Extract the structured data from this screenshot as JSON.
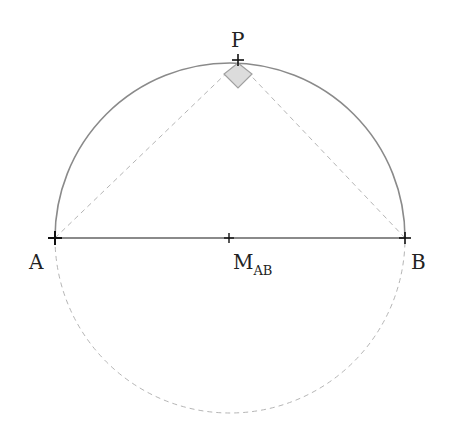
{
  "diagram": {
    "points": {
      "A": {
        "label": "A",
        "x": 55,
        "y": 238
      },
      "B": {
        "label": "B",
        "x": 405,
        "y": 238
      },
      "M": {
        "label": "M",
        "subscript": "AB",
        "x": 229,
        "y": 238
      },
      "P": {
        "label": "P",
        "x": 238,
        "y": 62
      }
    },
    "circle": {
      "cx": 230,
      "cy": 238,
      "r": 175
    },
    "colors": {
      "arc_solid": "#8a8a8a",
      "dashed": "#b5b5b5",
      "diameter": "#8a8a8a",
      "right_angle_fill": "#dcdcdc",
      "right_angle_stroke": "#a0a0a0",
      "point_marker": "#111111"
    }
  }
}
